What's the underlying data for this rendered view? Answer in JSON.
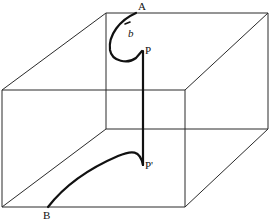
{
  "diagram": {
    "labels": {
      "A": "A",
      "b": "b",
      "P": "P",
      "P_prime": "P'",
      "B": "B"
    },
    "colors": {
      "edge": "#2a2a2a",
      "path": "#111111",
      "background": "#ffffff"
    }
  }
}
